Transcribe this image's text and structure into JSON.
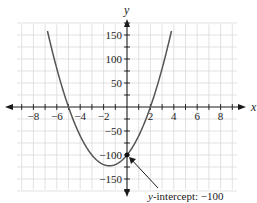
{
  "chart_data": {
    "type": "line",
    "title": "",
    "xlabel": "x",
    "ylabel": "y",
    "function": "y = 10x^2 + 30x - 100",
    "xlim": [
      -9.5,
      9.5
    ],
    "ylim": [
      -175,
      175
    ],
    "grid": true,
    "x_ticks": [
      -8,
      -6,
      -4,
      -2,
      2,
      4,
      6,
      8
    ],
    "x_tick_labels": [
      "−8",
      "−6",
      "−4",
      "−2",
      "2",
      "4",
      "6",
      "8"
    ],
    "y_ticks": [
      150,
      100,
      50,
      -50,
      -100,
      -150
    ],
    "y_tick_labels": [
      "150",
      "100",
      "50",
      "−50",
      "−100",
      "−150"
    ],
    "series": [
      {
        "name": "parabola",
        "x": [
          -6.8,
          -6,
          -5,
          -4,
          -3,
          -2,
          -1.5,
          -1,
          0,
          1,
          2,
          3,
          3.8
        ],
        "y": [
          158,
          80,
          0,
          -60,
          -100,
          -120,
          -122.5,
          -120,
          -100,
          -60,
          0,
          80,
          158
        ]
      }
    ],
    "key_points": {
      "x_intercepts": [
        -5,
        2
      ],
      "y_intercept": -100,
      "vertex": [
        -1.5,
        -122.5
      ]
    },
    "annotations": [
      {
        "text": "y-intercept: −100",
        "point": [
          0,
          -100
        ]
      }
    ]
  },
  "labels": {
    "x_axis": "x",
    "y_axis": "y",
    "annotation_italic": "y",
    "annotation_rest": "-intercept: −100"
  }
}
